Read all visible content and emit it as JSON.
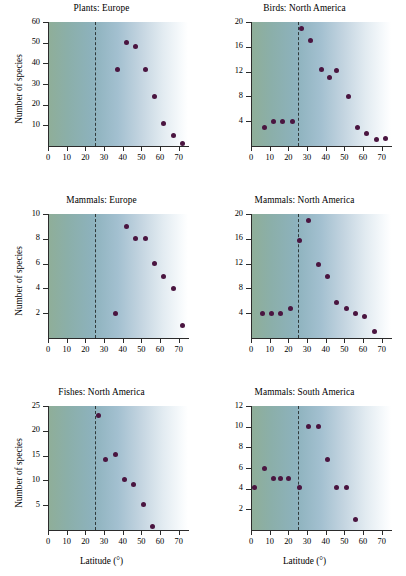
{
  "figure": {
    "shared_y_axis_label": "Number of species",
    "shared_x_axis_label": "Latitude (°)",
    "dot_color": "#4a1540",
    "reference_line_latitude": 25,
    "background_gradient": [
      "#8fae98",
      "#a3c0d0",
      "#ffffff"
    ]
  },
  "chart_data": [
    {
      "type": "scatter",
      "title": "Plants: Europe",
      "xlabel": "Latitude (°)",
      "ylabel": "Number of species",
      "xlim": [
        0,
        75
      ],
      "ylim": [
        0,
        60
      ],
      "xticks": [
        0,
        10,
        20,
        30,
        40,
        50,
        60,
        70
      ],
      "yticks": [
        10,
        20,
        30,
        40,
        50,
        60
      ],
      "grid": false,
      "vline": 25,
      "points": [
        {
          "x": 37,
          "y": 37
        },
        {
          "x": 42,
          "y": 50
        },
        {
          "x": 47,
          "y": 48
        },
        {
          "x": 52,
          "y": 37
        },
        {
          "x": 57,
          "y": 24
        },
        {
          "x": 62,
          "y": 11
        },
        {
          "x": 67,
          "y": 5
        },
        {
          "x": 72,
          "y": 1
        }
      ]
    },
    {
      "type": "scatter",
      "title": "Birds: North America",
      "xlabel": "Latitude (°)",
      "ylabel": "Number of species",
      "xlim": [
        0,
        75
      ],
      "ylim": [
        0,
        20
      ],
      "xticks": [
        0,
        10,
        20,
        30,
        40,
        50,
        60,
        70
      ],
      "yticks": [
        4,
        8,
        12,
        16,
        20
      ],
      "grid": false,
      "vline": 25,
      "points": [
        {
          "x": 7,
          "y": 3
        },
        {
          "x": 12,
          "y": 4
        },
        {
          "x": 17,
          "y": 4
        },
        {
          "x": 22,
          "y": 4
        },
        {
          "x": 27,
          "y": 19
        },
        {
          "x": 32,
          "y": 17
        },
        {
          "x": 38,
          "y": 12.3
        },
        {
          "x": 42,
          "y": 11
        },
        {
          "x": 46,
          "y": 12.1
        },
        {
          "x": 52,
          "y": 8
        },
        {
          "x": 57,
          "y": 3
        },
        {
          "x": 62,
          "y": 2
        },
        {
          "x": 67,
          "y": 1
        },
        {
          "x": 72,
          "y": 1.2
        }
      ]
    },
    {
      "type": "scatter",
      "title": "Mammals: Europe",
      "xlabel": "Latitude (°)",
      "ylabel": "Number of species",
      "xlim": [
        0,
        75
      ],
      "ylim": [
        0,
        10
      ],
      "xticks": [
        0,
        10,
        20,
        30,
        40,
        50,
        60,
        70
      ],
      "yticks": [
        2,
        4,
        6,
        8,
        10
      ],
      "grid": false,
      "vline": 25,
      "points": [
        {
          "x": 36,
          "y": 2
        },
        {
          "x": 42,
          "y": 9
        },
        {
          "x": 47,
          "y": 8
        },
        {
          "x": 52,
          "y": 8
        },
        {
          "x": 57,
          "y": 6
        },
        {
          "x": 62,
          "y": 5
        },
        {
          "x": 67,
          "y": 4
        },
        {
          "x": 72,
          "y": 1
        }
      ]
    },
    {
      "type": "scatter",
      "title": "Mammals: North America",
      "xlabel": "Latitude (°)",
      "ylabel": "Number of species",
      "xlim": [
        0,
        75
      ],
      "ylim": [
        0,
        20
      ],
      "xticks": [
        0,
        10,
        20,
        30,
        40,
        50,
        60,
        70
      ],
      "yticks": [
        4,
        8,
        12,
        16,
        20
      ],
      "grid": false,
      "vline": 25,
      "points": [
        {
          "x": 6,
          "y": 4
        },
        {
          "x": 11,
          "y": 4
        },
        {
          "x": 16,
          "y": 3.9
        },
        {
          "x": 21,
          "y": 4.7
        },
        {
          "x": 26,
          "y": 15.8
        },
        {
          "x": 31,
          "y": 19
        },
        {
          "x": 36,
          "y": 11.8
        },
        {
          "x": 41,
          "y": 10
        },
        {
          "x": 46,
          "y": 5.8
        },
        {
          "x": 51,
          "y": 4.8
        },
        {
          "x": 56,
          "y": 4
        },
        {
          "x": 61,
          "y": 3.4
        },
        {
          "x": 66,
          "y": 1
        }
      ]
    },
    {
      "type": "scatter",
      "title": "Fishes: North America",
      "xlabel": "Latitude (°)",
      "ylabel": "Number of species",
      "xlim": [
        0,
        75
      ],
      "ylim": [
        0,
        25
      ],
      "xticks": [
        0,
        10,
        20,
        30,
        40,
        50,
        60,
        70
      ],
      "yticks": [
        5,
        10,
        15,
        20,
        25
      ],
      "grid": false,
      "vline": 25,
      "points": [
        {
          "x": 27,
          "y": 23
        },
        {
          "x": 31,
          "y": 14.2
        },
        {
          "x": 36,
          "y": 15.2
        },
        {
          "x": 41,
          "y": 10.1
        },
        {
          "x": 46,
          "y": 9.1
        },
        {
          "x": 51,
          "y": 5.1
        },
        {
          "x": 56,
          "y": 0.8
        }
      ]
    },
    {
      "type": "scatter",
      "title": "Mammals: South America",
      "xlabel": "Latitude (°)",
      "ylabel": "Number of species",
      "xlim": [
        0,
        75
      ],
      "ylim": [
        0,
        12
      ],
      "xticks": [
        0,
        10,
        20,
        30,
        40,
        50,
        60,
        70
      ],
      "yticks": [
        2,
        4,
        6,
        8,
        10,
        12
      ],
      "grid": false,
      "vline": 25,
      "points": [
        {
          "x": 2,
          "y": 4.1
        },
        {
          "x": 7,
          "y": 6
        },
        {
          "x": 12,
          "y": 5
        },
        {
          "x": 16,
          "y": 5
        },
        {
          "x": 20,
          "y": 5
        },
        {
          "x": 26,
          "y": 4.1
        },
        {
          "x": 31,
          "y": 10
        },
        {
          "x": 36,
          "y": 10
        },
        {
          "x": 41,
          "y": 6.8
        },
        {
          "x": 46,
          "y": 4.1
        },
        {
          "x": 51,
          "y": 4.1
        },
        {
          "x": 56,
          "y": 1
        }
      ]
    }
  ]
}
